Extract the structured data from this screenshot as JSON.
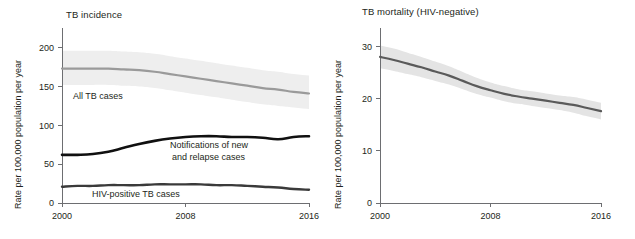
{
  "figure": {
    "background_color": "#ffffff",
    "text_color": "#231f20",
    "axis_color": "#6d6e71"
  },
  "panels": {
    "incidence": {
      "title": "TB incidence",
      "ylabel": "Rate per 100,000 population per year",
      "ytick_labels": [
        "0",
        "50",
        "100",
        "150",
        "200"
      ],
      "xtick_labels": [
        "2000",
        "2008",
        "2016"
      ],
      "annotations": {
        "all_tb": "All TB cases",
        "notifications_line1": "Notifications of new",
        "notifications_line2": "and relapse cases",
        "hiv_positive": "HIV-positive TB cases"
      }
    },
    "mortality": {
      "title": "TB mortality (HIV-negative)",
      "ylabel": "Rate per 100,000 population per year",
      "ytick_labels": [
        "0",
        "10",
        "20",
        "30"
      ],
      "xtick_labels": [
        "2000",
        "2008",
        "2016"
      ]
    }
  },
  "chart_data": [
    {
      "type": "line",
      "title": "TB incidence",
      "xlabel": "",
      "ylabel": "Rate per 100,000 population per year",
      "xlim": [
        2000,
        2016
      ],
      "ylim": [
        0,
        215
      ],
      "yticks": [
        0,
        50,
        100,
        150,
        200
      ],
      "xticks": [
        2000,
        2008,
        2016
      ],
      "grid": false,
      "legend": "inline-annotations",
      "x": [
        2000,
        2001,
        2002,
        2003,
        2004,
        2005,
        2006,
        2007,
        2008,
        2009,
        2010,
        2011,
        2012,
        2013,
        2014,
        2015,
        2016
      ],
      "series": [
        {
          "name": "All TB cases",
          "color": "#9a9a9a",
          "line_width": 2.2,
          "values": [
            173,
            173,
            173,
            173,
            172,
            171,
            169,
            166,
            163,
            160,
            157,
            154,
            151,
            148,
            146,
            143,
            141
          ],
          "band": {
            "name": "uncertainty interval",
            "color": "#eeeeee",
            "lower": [
              152,
              152,
              152,
              152,
              151,
              150,
              148,
              145,
              142,
              139,
              136,
              133,
              130,
              127,
              125,
              123,
              121
            ],
            "upper": [
              196,
              196,
              196,
              196,
              195,
              194,
              192,
              189,
              186,
              183,
              180,
              177,
              174,
              171,
              169,
              166,
              164
            ]
          }
        },
        {
          "name": "Notifications of new and relapse cases",
          "color": "#101010",
          "line_width": 2.6,
          "values": [
            62,
            62,
            63,
            66,
            71,
            76,
            80,
            83,
            85,
            86,
            86,
            85,
            85,
            84,
            82,
            85,
            86
          ]
        },
        {
          "name": "HIV-positive TB cases",
          "color": "#3a3a3a",
          "line_width": 2.4,
          "values": [
            21,
            22,
            22,
            23,
            23,
            23,
            24,
            24,
            24,
            24,
            23,
            23,
            22,
            21,
            20,
            18,
            17
          ]
        }
      ]
    },
    {
      "type": "line",
      "title": "TB mortality (HIV-negative)",
      "xlabel": "",
      "ylabel": "Rate per 100,000 population per year",
      "xlim": [
        2000,
        2016
      ],
      "ylim": [
        0,
        32
      ],
      "yticks": [
        0,
        10,
        20,
        30
      ],
      "xticks": [
        2000,
        2008,
        2016
      ],
      "grid": false,
      "legend": "none",
      "x": [
        2000,
        2001,
        2002,
        2003,
        2004,
        2005,
        2006,
        2007,
        2008,
        2009,
        2010,
        2011,
        2012,
        2013,
        2014,
        2015,
        2016
      ],
      "series": [
        {
          "name": "TB mortality (HIV-negative)",
          "color": "#5a5a5a",
          "line_width": 2.2,
          "values": [
            28.0,
            27.4,
            26.7,
            26.0,
            25.2,
            24.4,
            23.4,
            22.4,
            21.6,
            20.9,
            20.4,
            20.0,
            19.6,
            19.2,
            18.8,
            18.2,
            17.6
          ],
          "band": {
            "name": "uncertainty interval",
            "color": "#e4e4e4",
            "lower": [
              25.8,
              25.3,
              24.7,
              24.1,
              23.4,
              22.7,
              21.8,
              20.9,
              20.2,
              19.5,
              19.0,
              18.6,
              18.2,
              17.8,
              17.3,
              16.6,
              16.0
            ],
            "upper": [
              30.2,
              29.6,
              28.8,
              28.0,
              27.1,
              26.2,
              25.1,
              24.0,
              23.1,
              22.4,
              21.8,
              21.4,
              21.0,
              20.6,
              20.3,
              19.8,
              19.2
            ]
          }
        }
      ]
    }
  ]
}
